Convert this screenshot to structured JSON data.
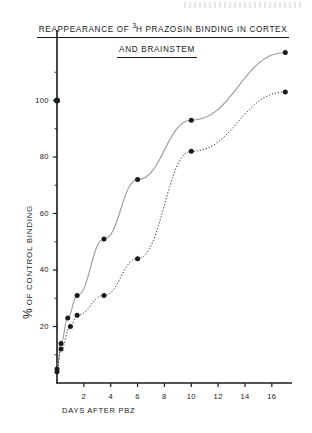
{
  "figure": {
    "title_line_1_prefix": "REAPPEARANCE OF ",
    "title_superscript": "3",
    "title_line_1_suffix": "H PRAZOSIN  BINDING  IN  CORTEX",
    "title_line_2": "AND   BRAINSTEM",
    "background_color": "#ffffff",
    "ink_color": "#1a1a1a"
  },
  "chart_data": {
    "type": "line",
    "title": "REAPPEARANCE OF 3H PRAZOSIN BINDING IN CORTEX AND BRAINSTEM",
    "xlabel": "DAYS AFTER PBZ",
    "ylabel": "% OF CONTROL BINDING",
    "xlim": [
      0,
      17.5
    ],
    "ylim": [
      0,
      120
    ],
    "xticks": [
      2,
      4,
      6,
      8,
      10,
      12,
      14,
      16
    ],
    "yticks": [
      20,
      40,
      60,
      80,
      100
    ],
    "xtick_labels": [
      "2",
      "4",
      "6",
      "8",
      "10",
      "12",
      "14",
      "16"
    ],
    "ytick_labels": [
      "20",
      "40",
      "60",
      "80",
      "100"
    ],
    "grid": false,
    "legend": "none",
    "marker": "filled-circle",
    "series": [
      {
        "name": "CORTEX",
        "line_style": "solid",
        "color": "#1a1a1a",
        "x": [
          0,
          0.3,
          0.8,
          1.5,
          3.5,
          6,
          10,
          17
        ],
        "values": [
          5,
          14,
          23,
          31,
          51,
          72,
          93,
          117
        ]
      },
      {
        "name": "BRAINSTEM",
        "line_style": "dotted",
        "color": "#1a1a1a",
        "x": [
          0,
          0.3,
          1,
          1.5,
          3.5,
          6,
          10,
          17
        ],
        "values": [
          4,
          12,
          20,
          24,
          31,
          44,
          82,
          103
        ]
      }
    ],
    "annotations": [
      {
        "name": "control-point",
        "x": 0,
        "y": 100,
        "marker": "filled-circle",
        "note": "control value on y-axis at 100%"
      }
    ]
  }
}
